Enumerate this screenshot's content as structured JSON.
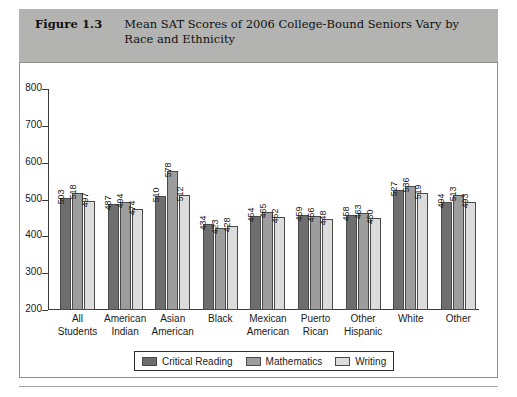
{
  "figure": {
    "number": "Figure 1.3",
    "caption": "Mean SAT Scores of 2006 College-Bound Seniors Vary by Race and Ethnicity"
  },
  "colors": {
    "header_band": "#b3b3b1",
    "series_critical_reading": "#6e6e6e",
    "series_mathematics": "#9d9d9d",
    "series_writing": "#dcdcda",
    "axis": "#3a3a3a",
    "card_border": "#8e8e8e"
  },
  "chart_data": {
    "type": "bar",
    "title": "Mean SAT Scores of 2006 College-Bound Seniors Vary by Race and Ethnicity",
    "xlabel": "",
    "ylabel": "",
    "ylim": [
      200,
      800
    ],
    "yticks": [
      200,
      300,
      400,
      500,
      600,
      700,
      800
    ],
    "grid": false,
    "legend_position": "bottom",
    "categories": [
      "All Students",
      "American Indian",
      "Asian American",
      "Black",
      "Mexican American",
      "Puerto Rican",
      "Other Hispanic",
      "White",
      "Other"
    ],
    "category_lines": [
      [
        "All",
        "Students"
      ],
      [
        "American",
        "Indian"
      ],
      [
        "Asian",
        "American"
      ],
      [
        "Black",
        ""
      ],
      [
        "Mexican",
        "American"
      ],
      [
        "Puerto",
        "Rican"
      ],
      [
        "Other",
        "Hispanic"
      ],
      [
        "White",
        ""
      ],
      [
        "Other",
        ""
      ]
    ],
    "series": [
      {
        "name": "Critical Reading",
        "values": [
          503,
          487,
          510,
          434,
          454,
          459,
          458,
          527,
          494
        ]
      },
      {
        "name": "Mathematics",
        "values": [
          518,
          494,
          578,
          423,
          465,
          456,
          463,
          536,
          513
        ]
      },
      {
        "name": "Writing",
        "values": [
          497,
          474,
          512,
          428,
          452,
          448,
          450,
          519,
          493
        ]
      }
    ]
  }
}
